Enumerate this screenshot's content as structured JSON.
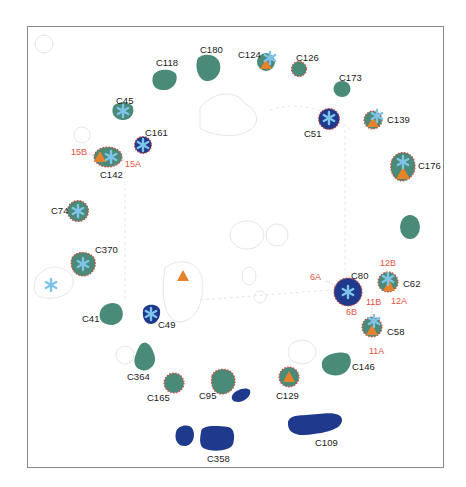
{
  "colors": {
    "teal": "#4a8a78",
    "navy": "#1f3a8c",
    "orange": "#e8822a",
    "asterisk": "#7fc4ea",
    "red_dot": "#d94a3a",
    "frame": "#8a8a8a",
    "ghost": "#e6e6e6"
  },
  "clusters": [
    {
      "id": "C180",
      "label": "C180"
    },
    {
      "id": "C118",
      "label": "C118"
    },
    {
      "id": "C45",
      "label": "C45"
    },
    {
      "id": "C161",
      "label": "C161"
    },
    {
      "id": "C142",
      "label": "C142"
    },
    {
      "id": "C124",
      "label": "C124"
    },
    {
      "id": "C126",
      "label": "C126"
    },
    {
      "id": "C173",
      "label": "C173"
    },
    {
      "id": "C51",
      "label": "C51"
    },
    {
      "id": "C139",
      "label": "C139"
    },
    {
      "id": "C176",
      "label": "C176"
    },
    {
      "id": "C74",
      "label": "C74"
    },
    {
      "id": "C370",
      "label": "C370"
    },
    {
      "id": "C80",
      "label": "C80"
    },
    {
      "id": "C62",
      "label": "C62"
    },
    {
      "id": "C58",
      "label": "C58"
    },
    {
      "id": "C41",
      "label": "C41"
    },
    {
      "id": "C49",
      "label": "C49"
    },
    {
      "id": "C364",
      "label": "C364"
    },
    {
      "id": "C165",
      "label": "C165"
    },
    {
      "id": "C95",
      "label": "C95"
    },
    {
      "id": "C129",
      "label": "C129"
    },
    {
      "id": "C146",
      "label": "C146"
    },
    {
      "id": "C109",
      "label": "C109"
    },
    {
      "id": "C358",
      "label": "C358"
    }
  ],
  "sites": {
    "s15B": "15B",
    "s15A": "15A",
    "s12B": "12B",
    "s12A": "12A",
    "s6A": "6A",
    "s6B": "6B",
    "s11B": "11B",
    "s11A": "11A"
  },
  "legend_symbols": {
    "asterisk": "*",
    "triangle": "▲"
  }
}
